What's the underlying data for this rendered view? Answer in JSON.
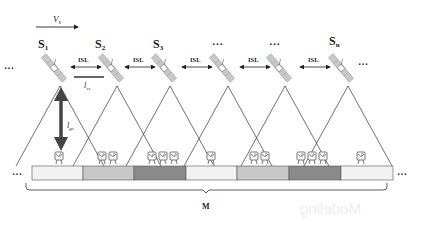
{
  "diagram": {
    "velocity_label": "V",
    "velocity_subscript": "s",
    "satellites": [
      {
        "label": "S",
        "sub": "1",
        "x": 60
      },
      {
        "label": "S",
        "sub": "2",
        "x": 117
      },
      {
        "label": "S",
        "sub": "3",
        "x": 170
      },
      {
        "label": "…",
        "sub": "",
        "x": 228
      },
      {
        "label": "…",
        "sub": "",
        "x": 285
      },
      {
        "label": "S",
        "sub": "n",
        "x": 345
      }
    ],
    "isl_label": "ISL",
    "isl_distance_label": "l",
    "isl_distance_sub": "ss",
    "ground_distance_label": "l",
    "ground_distance_sub": "gs",
    "ellipsis": "···",
    "region_label": "M",
    "strip_segments": [
      {
        "shade": "very-light",
        "color": "#f2f2f2"
      },
      {
        "shade": "medium-light",
        "color": "#c8c8c8"
      },
      {
        "shade": "dark",
        "color": "#8a8a8a"
      },
      {
        "shade": "very-light",
        "color": "#f2f2f2"
      },
      {
        "shade": "medium-light",
        "color": "#c8c8c8"
      },
      {
        "shade": "dark",
        "color": "#8a8a8a"
      },
      {
        "shade": "very-light",
        "color": "#f2f2f2"
      }
    ],
    "ground_stations_per_segment": [
      1,
      2,
      3,
      1,
      2,
      3,
      1
    ]
  },
  "ghost_text": "Modeling"
}
